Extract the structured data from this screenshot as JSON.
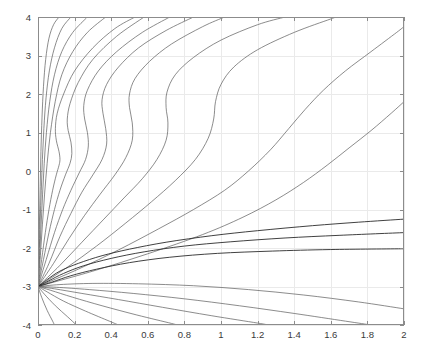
{
  "chart_data": {
    "type": "line",
    "title": "",
    "subtitle": "",
    "xlabel": "",
    "ylabel": "",
    "xlim": [
      0,
      2
    ],
    "ylim": [
      -4,
      4
    ],
    "grid": true,
    "legend": null,
    "legend_position": "none",
    "annotations": [],
    "singular_point": [
      0,
      -3
    ],
    "x_ticks": [
      0,
      0.2,
      0.4,
      0.6,
      0.8,
      1,
      1.2,
      1.4,
      1.6,
      1.8,
      2
    ],
    "x_tick_labels": [
      "0",
      "0.2",
      "0.4",
      "0.6",
      "0.8",
      "1",
      "1.2",
      "1.4",
      "1.6",
      "1.8",
      "2"
    ],
    "y_ticks": [
      -4,
      -3,
      -2,
      -1,
      0,
      1,
      2,
      3,
      4
    ],
    "y_tick_labels": [
      "-4",
      "-3",
      "-2",
      "-1",
      "0",
      "1",
      "2",
      "3",
      "4"
    ],
    "colors": {
      "curve": "#5a5a5a",
      "separatrix": "#2b2b2b",
      "grid": "#eaeaea",
      "axis": "#8c8c8c",
      "background": "#ffffff",
      "tick_text": "#3a3a3a"
    },
    "series": [
      {
        "name": "upper-1",
        "kind": "upper",
        "points": [
          [
            0,
            -3
          ],
          [
            0.004,
            -2.2
          ],
          [
            0.008,
            -1.3
          ],
          [
            0.012,
            -0.4
          ],
          [
            0.016,
            0.5
          ],
          [
            0.022,
            1.4
          ],
          [
            0.03,
            2.2
          ],
          [
            0.042,
            2.9
          ],
          [
            0.06,
            3.45
          ],
          [
            0.085,
            3.8
          ],
          [
            0.115,
            4
          ]
        ]
      },
      {
        "name": "upper-2",
        "kind": "upper",
        "points": [
          [
            0,
            -3
          ],
          [
            0.006,
            -2.2
          ],
          [
            0.012,
            -1.3
          ],
          [
            0.018,
            -0.5
          ],
          [
            0.024,
            0.3
          ],
          [
            0.032,
            1.1
          ],
          [
            0.044,
            1.9
          ],
          [
            0.062,
            2.6
          ],
          [
            0.09,
            3.2
          ],
          [
            0.13,
            3.7
          ],
          [
            0.18,
            4
          ]
        ]
      },
      {
        "name": "upper-3",
        "kind": "upper",
        "points": [
          [
            0,
            -3
          ],
          [
            0.009,
            -2.2
          ],
          [
            0.017,
            -1.4
          ],
          [
            0.025,
            -0.6
          ],
          [
            0.034,
            0.2
          ],
          [
            0.046,
            1.0
          ],
          [
            0.064,
            1.8
          ],
          [
            0.09,
            2.5
          ],
          [
            0.13,
            3.1
          ],
          [
            0.19,
            3.6
          ],
          [
            0.27,
            4
          ]
        ]
      },
      {
        "name": "upper-4",
        "kind": "upper",
        "points": [
          [
            0,
            -3
          ],
          [
            0.013,
            -2.2
          ],
          [
            0.024,
            -1.4
          ],
          [
            0.036,
            -0.6
          ],
          [
            0.05,
            0.2
          ],
          [
            0.068,
            1.0
          ],
          [
            0.094,
            1.8
          ],
          [
            0.13,
            2.5
          ],
          [
            0.19,
            3.1
          ],
          [
            0.27,
            3.6
          ],
          [
            0.37,
            4
          ]
        ]
      },
      {
        "name": "upper-5-sbend",
        "kind": "upper-sbend",
        "points": [
          [
            0,
            -3
          ],
          [
            0.02,
            -2.3
          ],
          [
            0.04,
            -1.6
          ],
          [
            0.06,
            -1.0
          ],
          [
            0.08,
            -0.5
          ],
          [
            0.1,
            -0.1
          ],
          [
            0.115,
            0.15
          ],
          [
            0.12,
            0.3
          ],
          [
            0.115,
            0.5
          ],
          [
            0.1,
            0.8
          ],
          [
            0.095,
            1.1
          ],
          [
            0.105,
            1.5
          ],
          [
            0.14,
            2.0
          ],
          [
            0.2,
            2.6
          ],
          [
            0.3,
            3.2
          ],
          [
            0.42,
            3.7
          ],
          [
            0.53,
            4
          ]
        ]
      },
      {
        "name": "upper-6-sbend",
        "kind": "upper-sbend",
        "points": [
          [
            0,
            -3
          ],
          [
            0.03,
            -2.3
          ],
          [
            0.06,
            -1.6
          ],
          [
            0.09,
            -1.0
          ],
          [
            0.12,
            -0.5
          ],
          [
            0.15,
            -0.1
          ],
          [
            0.175,
            0.2
          ],
          [
            0.185,
            0.45
          ],
          [
            0.18,
            0.75
          ],
          [
            0.165,
            1.05
          ],
          [
            0.16,
            1.35
          ],
          [
            0.175,
            1.75
          ],
          [
            0.22,
            2.3
          ],
          [
            0.3,
            2.9
          ],
          [
            0.43,
            3.5
          ],
          [
            0.58,
            4
          ]
        ]
      },
      {
        "name": "upper-7-sbend",
        "kind": "upper-sbend",
        "points": [
          [
            0,
            -3
          ],
          [
            0.045,
            -2.3
          ],
          [
            0.09,
            -1.6
          ],
          [
            0.135,
            -1.0
          ],
          [
            0.18,
            -0.5
          ],
          [
            0.225,
            -0.05
          ],
          [
            0.26,
            0.3
          ],
          [
            0.275,
            0.65
          ],
          [
            0.27,
            1.0
          ],
          [
            0.255,
            1.35
          ],
          [
            0.25,
            1.7
          ],
          [
            0.27,
            2.1
          ],
          [
            0.33,
            2.6
          ],
          [
            0.43,
            3.1
          ],
          [
            0.57,
            3.6
          ],
          [
            0.72,
            4
          ]
        ]
      },
      {
        "name": "upper-8-sbend",
        "kind": "upper-sbend",
        "points": [
          [
            0,
            -3
          ],
          [
            0.06,
            -2.4
          ],
          [
            0.12,
            -1.7
          ],
          [
            0.18,
            -1.1
          ],
          [
            0.24,
            -0.55
          ],
          [
            0.3,
            -0.1
          ],
          [
            0.35,
            0.3
          ],
          [
            0.375,
            0.7
          ],
          [
            0.37,
            1.1
          ],
          [
            0.355,
            1.5
          ],
          [
            0.35,
            1.85
          ],
          [
            0.375,
            2.25
          ],
          [
            0.44,
            2.7
          ],
          [
            0.55,
            3.2
          ],
          [
            0.7,
            3.65
          ],
          [
            0.85,
            4
          ]
        ]
      },
      {
        "name": "upper-9-sbend",
        "kind": "upper-sbend",
        "points": [
          [
            0,
            -3
          ],
          [
            0.085,
            -2.4
          ],
          [
            0.17,
            -1.75
          ],
          [
            0.255,
            -1.15
          ],
          [
            0.34,
            -0.6
          ],
          [
            0.42,
            -0.1
          ],
          [
            0.48,
            0.35
          ],
          [
            0.515,
            0.8
          ],
          [
            0.515,
            1.25
          ],
          [
            0.5,
            1.65
          ],
          [
            0.5,
            2.0
          ],
          [
            0.53,
            2.4
          ],
          [
            0.61,
            2.85
          ],
          [
            0.73,
            3.3
          ],
          [
            0.9,
            3.75
          ],
          [
            1.02,
            4
          ]
        ]
      },
      {
        "name": "upper-10-sbend",
        "kind": "upper-sbend",
        "points": [
          [
            0,
            -3
          ],
          [
            0.12,
            -2.45
          ],
          [
            0.24,
            -1.85
          ],
          [
            0.36,
            -1.25
          ],
          [
            0.47,
            -0.7
          ],
          [
            0.57,
            -0.2
          ],
          [
            0.65,
            0.3
          ],
          [
            0.7,
            0.8
          ],
          [
            0.71,
            1.25
          ],
          [
            0.7,
            1.65
          ],
          [
            0.705,
            2.05
          ],
          [
            0.75,
            2.5
          ],
          [
            0.85,
            2.95
          ],
          [
            1.0,
            3.4
          ],
          [
            1.2,
            3.8
          ],
          [
            1.35,
            4
          ]
        ]
      },
      {
        "name": "upper-11-sbend",
        "kind": "upper-sbend",
        "points": [
          [
            0,
            -3
          ],
          [
            0.16,
            -2.5
          ],
          [
            0.32,
            -1.95
          ],
          [
            0.48,
            -1.35
          ],
          [
            0.62,
            -0.8
          ],
          [
            0.75,
            -0.25
          ],
          [
            0.86,
            0.3
          ],
          [
            0.93,
            0.85
          ],
          [
            0.96,
            1.35
          ],
          [
            0.97,
            1.8
          ],
          [
            1.0,
            2.25
          ],
          [
            1.07,
            2.7
          ],
          [
            1.2,
            3.15
          ],
          [
            1.4,
            3.6
          ],
          [
            1.6,
            3.95
          ],
          [
            1.63,
            4
          ]
        ]
      },
      {
        "name": "upper-12-late",
        "kind": "upper-sbend",
        "points": [
          [
            0,
            -3
          ],
          [
            0.22,
            -2.55
          ],
          [
            0.44,
            -2.05
          ],
          [
            0.66,
            -1.5
          ],
          [
            0.85,
            -1.0
          ],
          [
            1.02,
            -0.5
          ],
          [
            1.15,
            0.0
          ],
          [
            1.27,
            0.55
          ],
          [
            1.37,
            1.1
          ],
          [
            1.46,
            1.6
          ],
          [
            1.56,
            2.1
          ],
          [
            1.68,
            2.6
          ],
          [
            1.82,
            3.1
          ],
          [
            1.96,
            3.6
          ],
          [
            2,
            3.75
          ]
        ]
      },
      {
        "name": "upper-13-late",
        "kind": "upper-sbend",
        "points": [
          [
            0,
            -3
          ],
          [
            0.3,
            -2.6
          ],
          [
            0.6,
            -2.15
          ],
          [
            0.9,
            -1.65
          ],
          [
            1.12,
            -1.2
          ],
          [
            1.3,
            -0.75
          ],
          [
            1.45,
            -0.3
          ],
          [
            1.58,
            0.15
          ],
          [
            1.7,
            0.6
          ],
          [
            1.82,
            1.05
          ],
          [
            1.93,
            1.5
          ],
          [
            2,
            1.8
          ]
        ]
      },
      {
        "name": "separatrix-bundle-a",
        "kind": "separatrix",
        "points": [
          [
            0,
            -3
          ],
          [
            0.05,
            -2.82
          ],
          [
            0.12,
            -2.6
          ],
          [
            0.22,
            -2.4
          ],
          [
            0.35,
            -2.2
          ],
          [
            0.5,
            -2.03
          ],
          [
            0.7,
            -1.85
          ],
          [
            0.95,
            -1.68
          ],
          [
            1.2,
            -1.55
          ],
          [
            1.5,
            -1.42
          ],
          [
            1.75,
            -1.33
          ],
          [
            2,
            -1.25
          ]
        ]
      },
      {
        "name": "separatrix-bundle-b",
        "kind": "separatrix",
        "points": [
          [
            0,
            -3
          ],
          [
            0.06,
            -2.85
          ],
          [
            0.14,
            -2.66
          ],
          [
            0.25,
            -2.46
          ],
          [
            0.4,
            -2.27
          ],
          [
            0.58,
            -2.1
          ],
          [
            0.8,
            -1.95
          ],
          [
            1.05,
            -1.84
          ],
          [
            1.35,
            -1.74
          ],
          [
            1.65,
            -1.67
          ],
          [
            2,
            -1.6
          ]
        ]
      },
      {
        "name": "separatrix-bundle-c",
        "kind": "separatrix",
        "points": [
          [
            0,
            -3
          ],
          [
            0.08,
            -2.88
          ],
          [
            0.18,
            -2.72
          ],
          [
            0.32,
            -2.55
          ],
          [
            0.5,
            -2.38
          ],
          [
            0.72,
            -2.24
          ],
          [
            0.98,
            -2.14
          ],
          [
            1.28,
            -2.08
          ],
          [
            1.6,
            -2.04
          ],
          [
            2,
            -2.02
          ]
        ]
      },
      {
        "name": "lower-1",
        "kind": "lower",
        "points": [
          [
            0,
            -3
          ],
          [
            0.12,
            -2.95
          ],
          [
            0.3,
            -2.92
          ],
          [
            0.55,
            -2.93
          ],
          [
            0.85,
            -2.98
          ],
          [
            1.15,
            -3.08
          ],
          [
            1.45,
            -3.22
          ],
          [
            1.75,
            -3.4
          ],
          [
            2,
            -3.58
          ]
        ]
      },
      {
        "name": "lower-2",
        "kind": "lower",
        "points": [
          [
            0,
            -3
          ],
          [
            0.1,
            -3.02
          ],
          [
            0.28,
            -3.08
          ],
          [
            0.52,
            -3.18
          ],
          [
            0.8,
            -3.32
          ],
          [
            1.1,
            -3.5
          ],
          [
            1.4,
            -3.7
          ],
          [
            1.68,
            -3.9
          ],
          [
            1.82,
            -4
          ]
        ]
      },
      {
        "name": "lower-3",
        "kind": "lower",
        "points": [
          [
            0,
            -3
          ],
          [
            0.09,
            -3.06
          ],
          [
            0.24,
            -3.18
          ],
          [
            0.44,
            -3.34
          ],
          [
            0.68,
            -3.54
          ],
          [
            0.95,
            -3.76
          ],
          [
            1.2,
            -3.95
          ],
          [
            1.26,
            -4
          ]
        ]
      },
      {
        "name": "lower-4",
        "kind": "lower",
        "points": [
          [
            0,
            -3
          ],
          [
            0.07,
            -3.1
          ],
          [
            0.19,
            -3.28
          ],
          [
            0.35,
            -3.5
          ],
          [
            0.54,
            -3.74
          ],
          [
            0.73,
            -3.96
          ],
          [
            0.76,
            -4
          ]
        ]
      },
      {
        "name": "lower-5",
        "kind": "lower",
        "points": [
          [
            0,
            -3
          ],
          [
            0.05,
            -3.14
          ],
          [
            0.14,
            -3.38
          ],
          [
            0.26,
            -3.64
          ],
          [
            0.39,
            -3.9
          ],
          [
            0.44,
            -4
          ]
        ]
      },
      {
        "name": "lower-6",
        "kind": "lower",
        "points": [
          [
            0,
            -3
          ],
          [
            0.035,
            -3.2
          ],
          [
            0.095,
            -3.5
          ],
          [
            0.16,
            -3.78
          ],
          [
            0.21,
            -4
          ]
        ]
      },
      {
        "name": "lower-7",
        "kind": "lower",
        "points": [
          [
            0,
            -3
          ],
          [
            0.02,
            -3.28
          ],
          [
            0.05,
            -3.62
          ],
          [
            0.08,
            -3.9
          ],
          [
            0.09,
            -4
          ]
        ]
      }
    ]
  },
  "figure": {
    "background_color": "#ffffff"
  }
}
